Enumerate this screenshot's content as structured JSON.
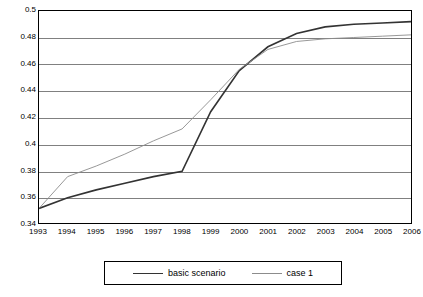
{
  "chart_data": {
    "type": "line",
    "title": "",
    "xlabel": "",
    "ylabel": "",
    "grid": true,
    "legend_position": "bottom",
    "x": [
      1993,
      1994,
      1995,
      1996,
      1997,
      1998,
      1999,
      2000,
      2001,
      2002,
      2003,
      2004,
      2005,
      2006
    ],
    "xlim": [
      1993,
      2006
    ],
    "ylim": [
      0.34,
      0.5
    ],
    "yticks": [
      "0.34",
      "0.36",
      "0.38",
      "0.4",
      "0.42",
      "0.44",
      "0.46",
      "0.48",
      "0.5"
    ],
    "ytick_values": [
      0.34,
      0.36,
      0.38,
      0.4,
      0.42,
      0.44,
      0.46,
      0.48,
      0.5
    ],
    "xticks": [
      "1993",
      "1994",
      "1995",
      "1996",
      "1997",
      "1998",
      "1999",
      "2000",
      "2001",
      "2002",
      "2003",
      "2004",
      "2005",
      "2006"
    ],
    "series": [
      {
        "name": "basic scenario",
        "color": "#333333",
        "width": 1.6,
        "values": [
          0.351,
          0.359,
          0.365,
          0.37,
          0.375,
          0.379,
          0.424,
          0.455,
          0.473,
          0.483,
          0.488,
          0.49,
          0.491,
          0.492
        ]
      },
      {
        "name": "case 1",
        "color": "#8c8c8c",
        "width": 0.9,
        "values": [
          0.351,
          0.375,
          0.383,
          0.392,
          0.402,
          0.411,
          0.433,
          0.456,
          0.471,
          0.477,
          0.479,
          0.48,
          0.481,
          0.482
        ]
      }
    ]
  },
  "legend": {
    "items": [
      {
        "label": "basic scenario"
      },
      {
        "label": "case 1"
      }
    ]
  }
}
